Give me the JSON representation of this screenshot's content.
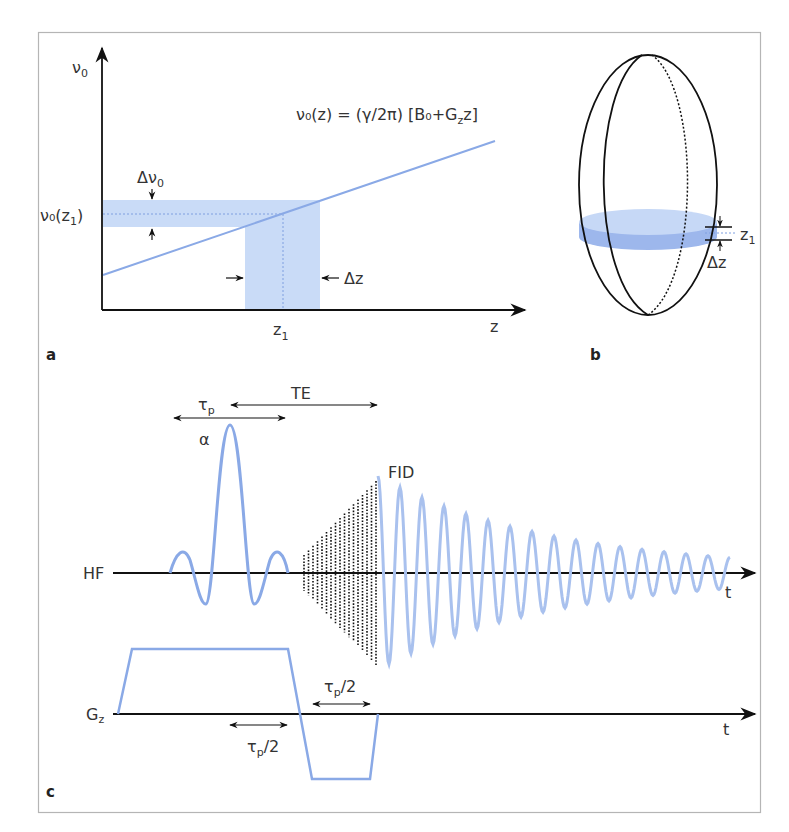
{
  "figure": {
    "colors": {
      "frame": "#b5b5b5",
      "axis": "#111111",
      "curve": "#8aa9e6",
      "curve_light": "#a9c1ee",
      "band": "#c9dbf7",
      "slice_top": "#c6d8f6",
      "slice_side": "#9db7ec"
    },
    "panel_a": {
      "label": "a",
      "y_axis_label": "ν",
      "y_axis_sub": "0",
      "x_axis_label": "z",
      "equation": "ν₀(z) = (γ/2π) [B₀+G",
      "equation_sub": "z",
      "equation_end": "z]",
      "band_label": "Δν",
      "band_label_sub": "0",
      "ylabel_point": "ν₀(z",
      "ylabel_point_sub": "1",
      "ylabel_point_end": ")",
      "xlabel_point": "z",
      "xlabel_point_sub": "1",
      "delta_z": "Δz"
    },
    "panel_b": {
      "label": "b",
      "slice_pos": "z",
      "slice_pos_sub": "1",
      "slice_thickness": "Δz"
    },
    "panel_c": {
      "label": "c",
      "rf_axis_label": "HF",
      "grad_axis_label": "G",
      "grad_axis_sub": "z",
      "time_label_rf": "t",
      "time_label_grad": "t",
      "pulse_duration": "τ",
      "pulse_duration_sub": "p",
      "echo_time": "TE",
      "flip_angle": "α",
      "signal_label": "FID",
      "refocus_label_1": "τ",
      "refocus_label_1_sub": "p",
      "refocus_label_1_end": "/2",
      "refocus_label_2": "τ",
      "refocus_label_2_sub": "p",
      "refocus_label_2_end": "/2"
    }
  }
}
